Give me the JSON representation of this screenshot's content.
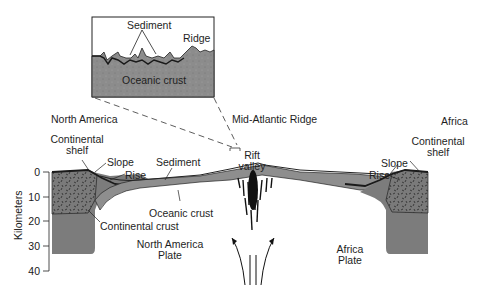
{
  "diagram": {
    "title": "Mid-Atlantic Ridge",
    "inset": {
      "labels": {
        "sediment": "Sediment",
        "ridge": "Ridge",
        "oceanic_crust": "Oceanic crust"
      }
    },
    "regions": {
      "north_america": "North America",
      "africa": "Africa"
    },
    "left_margin": {
      "continental_shelf": "Continental\nshelf",
      "continental_shelf_line1": "Continental",
      "continental_shelf_line2": "shelf",
      "slope": "Slope",
      "rise": "Rise"
    },
    "right_margin": {
      "continental_shelf_line1": "Continental",
      "continental_shelf_line2": "shelf",
      "slope": "Slope",
      "rise": "Rise"
    },
    "labels": {
      "sediment": "Sediment",
      "rift_valley_line1": "Rift",
      "rift_valley_line2": "valley",
      "oceanic_crust": "Oceanic crust",
      "continental_crust": "Continental crust",
      "north_america_plate_line1": "North America",
      "north_america_plate_line2": "Plate",
      "africa_plate_line1": "Africa",
      "africa_plate_line2": "Plate"
    },
    "y_axis": {
      "label": "Kilometers",
      "ticks": [
        "0",
        "10",
        "20",
        "30",
        "40"
      ]
    },
    "colors": {
      "crust": "#8a8a8a",
      "continental": "#6e6e6e",
      "dark": "#222222",
      "background": "#ffffff"
    }
  }
}
